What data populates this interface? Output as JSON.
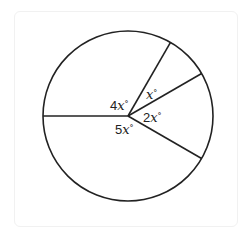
{
  "diagram": {
    "type": "circle-with-central-angles",
    "circle": {
      "cx": 128,
      "cy": 116,
      "r": 85,
      "stroke": "#222222"
    },
    "spoke_angles_deg": [
      180,
      60,
      30,
      -30
    ],
    "labels": [
      {
        "id": "angle-4x",
        "coef": "4",
        "var": "x",
        "unit": "°"
      },
      {
        "id": "angle-x",
        "coef": "",
        "var": "x",
        "unit": "°"
      },
      {
        "id": "angle-2x",
        "coef": "2",
        "var": "x",
        "unit": "°"
      },
      {
        "id": "angle-5x",
        "coef": "5",
        "var": "x",
        "unit": "°"
      }
    ]
  }
}
